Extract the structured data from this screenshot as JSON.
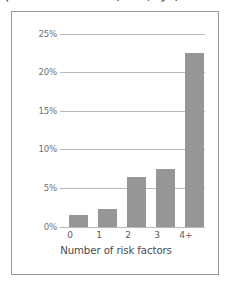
{
  "caption": {
    "text": "prevalence characteristics (Table ?; Fig. ?)"
  },
  "chart_data": {
    "type": "bar",
    "title": "",
    "xlabel": "Number of risk factors",
    "ylabel": "",
    "categories": [
      "0",
      "1",
      "2",
      "3",
      "4+"
    ],
    "values": [
      1.5,
      2.2,
      6.0,
      7.0,
      21.0
    ],
    "value_unit": "%",
    "ylim": [
      0,
      26
    ],
    "yticks": [
      0,
      5,
      10,
      15,
      20,
      25
    ],
    "ytick_labels": [
      "0%",
      "5%",
      "10%",
      "15%",
      "20%",
      "25%"
    ],
    "grid": true,
    "legend": false,
    "bar_color": "#969696",
    "gridline_color": "#b9b9b9",
    "frame_color": "#9a9a9a"
  }
}
